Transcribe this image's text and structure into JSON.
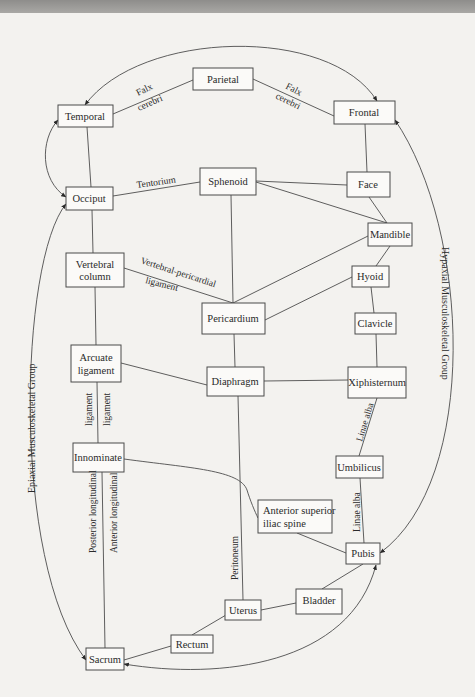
{
  "diagram": {
    "type": "anatomical-connection-diagram",
    "nodes": [
      {
        "id": "parietal",
        "label": "Parietal"
      },
      {
        "id": "temporal",
        "label": "Temporal"
      },
      {
        "id": "frontal",
        "label": "Frontal"
      },
      {
        "id": "occiput",
        "label": "Occiput"
      },
      {
        "id": "sphenoid",
        "label": "Sphenoid"
      },
      {
        "id": "face",
        "label": "Face"
      },
      {
        "id": "mandible",
        "label": "Mandible"
      },
      {
        "id": "vertebral_column",
        "label_line1": "Vertebral",
        "label_line2": "column"
      },
      {
        "id": "hyoid",
        "label": "Hyoid"
      },
      {
        "id": "pericardium",
        "label": "Pericardium"
      },
      {
        "id": "clavicle",
        "label": "Clavicle"
      },
      {
        "id": "arcuate_ligament",
        "label_line1": "Arcuate",
        "label_line2": "ligament"
      },
      {
        "id": "diaphragm",
        "label": "Diaphragm"
      },
      {
        "id": "xiphisternum",
        "label": "Xiphisternum"
      },
      {
        "id": "innominate",
        "label": "Innominate"
      },
      {
        "id": "umbilicus",
        "label": "Umbilicus"
      },
      {
        "id": "asis",
        "label_line1": "Anterior superior",
        "label_line2": "iliac spine"
      },
      {
        "id": "pubis",
        "label": "Pubis"
      },
      {
        "id": "bladder",
        "label": "Bladder"
      },
      {
        "id": "uterus",
        "label": "Uterus"
      },
      {
        "id": "rectum",
        "label": "Rectum"
      },
      {
        "id": "sacrum",
        "label": "Sacrum"
      }
    ],
    "edge_labels": {
      "falx_left_1": "Falx",
      "falx_left_2": "cerebri",
      "falx_right_1": "Falx",
      "falx_right_2": "cerebri",
      "tentorium": "Tentorium",
      "vert_peri_1": "Vertebral-pericardial",
      "vert_peri_2": "ligament",
      "ligament_left": "ligament",
      "ligament_right": "ligament",
      "posterior_longitudinal": "Posterior longitudinal",
      "anterior_longitudinal": "Anterior longitudinal",
      "peritoneum": "Peritoneum",
      "linae_alba_upper": "Linae alba",
      "linae_alba_lower": "Linae alba"
    },
    "group_labels": {
      "epiaxial": "Epiaxial Musculoskeletal Group",
      "hypaxial": "Hypaxial Musculoskeletal Group"
    },
    "edges": [
      [
        "temporal",
        "parietal"
      ],
      [
        "parietal",
        "frontal"
      ],
      [
        "temporal",
        "occiput"
      ],
      [
        "occiput",
        "sphenoid"
      ],
      [
        "frontal",
        "face"
      ],
      [
        "sphenoid",
        "face"
      ],
      [
        "sphenoid",
        "mandible"
      ],
      [
        "face",
        "mandible"
      ],
      [
        "sphenoid",
        "pericardium"
      ],
      [
        "mandible",
        "pericardium"
      ],
      [
        "mandible",
        "hyoid"
      ],
      [
        "hyoid",
        "pericardium"
      ],
      [
        "hyoid",
        "clavicle"
      ],
      [
        "occiput",
        "vertebral_column"
      ],
      [
        "vertebral_column",
        "pericardium"
      ],
      [
        "vertebral_column",
        "arcuate_ligament"
      ],
      [
        "pericardium",
        "diaphragm"
      ],
      [
        "clavicle",
        "xiphisternum"
      ],
      [
        "arcuate_ligament",
        "diaphragm"
      ],
      [
        "diaphragm",
        "xiphisternum"
      ],
      [
        "arcuate_ligament",
        "innominate"
      ],
      [
        "xiphisternum",
        "umbilicus"
      ],
      [
        "innominate",
        "asis"
      ],
      [
        "umbilicus",
        "pubis"
      ],
      [
        "asis",
        "pubis"
      ],
      [
        "diaphragm",
        "uterus"
      ],
      [
        "innominate",
        "sacrum"
      ],
      [
        "pubis",
        "bladder"
      ],
      [
        "bladder",
        "uterus"
      ],
      [
        "uterus",
        "rectum"
      ],
      [
        "rectum",
        "sacrum"
      ]
    ],
    "arrows": [
      [
        "parietal-arc",
        "temporal<->frontal"
      ],
      [
        "temporal<->occiput"
      ],
      [
        "sacrum<->occiput (Epiaxial)"
      ],
      [
        "frontal<->pubis (Hypaxial)"
      ],
      [
        "sacrum<->pubis"
      ]
    ]
  }
}
